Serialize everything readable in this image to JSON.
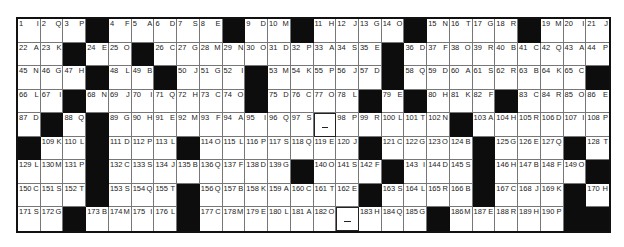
{
  "puzzle": {
    "type": "acrostic",
    "columns": 26,
    "rows": 9,
    "grid": [
      [
        {
          "n": "1",
          "c": "I"
        },
        {
          "n": "2",
          "c": "Q"
        },
        {
          "n": "3",
          "c": "P"
        },
        {
          "b": 1
        },
        {
          "n": "4",
          "c": "F"
        },
        {
          "n": "5",
          "c": "A"
        },
        {
          "n": "6",
          "c": "D"
        },
        {
          "n": "7",
          "c": "S"
        },
        {
          "n": "8",
          "c": "E"
        },
        {
          "b": 1
        },
        {
          "n": "9",
          "c": "D"
        },
        {
          "n": "10",
          "c": "M"
        },
        {
          "b": 1
        },
        {
          "n": "11",
          "c": "H"
        },
        {
          "n": "12",
          "c": "J"
        },
        {
          "n": "13",
          "c": "G"
        },
        {
          "n": "14",
          "c": "O"
        },
        {
          "b": 1
        },
        {
          "n": "15",
          "c": "N"
        },
        {
          "n": "16",
          "c": "T"
        },
        {
          "n": "17",
          "c": "G"
        },
        {
          "n": "18",
          "c": "R"
        },
        {
          "b": 1
        },
        {
          "n": "19",
          "c": "M"
        },
        {
          "n": "20",
          "c": "I"
        },
        {
          "n": "21",
          "c": "J"
        }
      ],
      [
        {
          "n": "22",
          "c": "A"
        },
        {
          "n": "23",
          "c": "K"
        },
        {
          "b": 1
        },
        {
          "n": "24",
          "c": "E"
        },
        {
          "n": "25",
          "c": "O"
        },
        {
          "b": 1
        },
        {
          "n": "26",
          "c": "C"
        },
        {
          "n": "27",
          "c": "G"
        },
        {
          "n": "28",
          "c": "M"
        },
        {
          "n": "29",
          "c": "N"
        },
        {
          "n": "30",
          "c": "O"
        },
        {
          "n": "31",
          "c": "D"
        },
        {
          "n": "32",
          "c": "P"
        },
        {
          "n": "33",
          "c": "A"
        },
        {
          "n": "34",
          "c": "S"
        },
        {
          "n": "35",
          "c": "E"
        },
        {
          "b": 1
        },
        {
          "n": "36",
          "c": "D"
        },
        {
          "n": "37",
          "c": "F"
        },
        {
          "n": "38",
          "c": "O"
        },
        {
          "n": "39",
          "c": "R"
        },
        {
          "n": "40",
          "c": "B"
        },
        {
          "n": "41",
          "c": "C"
        },
        {
          "n": "42",
          "c": "Q"
        },
        {
          "n": "43",
          "c": "A"
        },
        {
          "n": "44",
          "c": "P"
        }
      ],
      [
        {
          "n": "45",
          "c": "N"
        },
        {
          "n": "46",
          "c": "G"
        },
        {
          "n": "47",
          "c": "H"
        },
        {
          "b": 1
        },
        {
          "n": "48",
          "c": "L"
        },
        {
          "n": "49",
          "c": "B"
        },
        {
          "b": 1
        },
        {
          "n": "50",
          "c": "J"
        },
        {
          "n": "51",
          "c": "G"
        },
        {
          "n": "52",
          "c": "I"
        },
        {
          "b": 1
        },
        {
          "n": "53",
          "c": "M"
        },
        {
          "n": "54",
          "c": "K"
        },
        {
          "n": "55",
          "c": "P"
        },
        {
          "n": "56",
          "c": "J"
        },
        {
          "n": "57",
          "c": "D"
        },
        {
          "b": 1
        },
        {
          "n": "58",
          "c": "Q"
        },
        {
          "n": "59",
          "c": "D"
        },
        {
          "n": "60",
          "c": "A"
        },
        {
          "n": "61",
          "c": "S"
        },
        {
          "n": "62",
          "c": "R"
        },
        {
          "n": "63",
          "c": "B"
        },
        {
          "n": "64",
          "c": "K"
        },
        {
          "n": "65",
          "c": "C"
        },
        {
          "b": 1
        }
      ],
      [
        {
          "n": "66",
          "c": "L"
        },
        {
          "n": "67",
          "c": "I"
        },
        {
          "b": 1
        },
        {
          "n": "68",
          "c": "N"
        },
        {
          "n": "69",
          "c": "J"
        },
        {
          "n": "70",
          "c": "I"
        },
        {
          "n": "71",
          "c": "Q"
        },
        {
          "n": "72",
          "c": "H"
        },
        {
          "n": "73",
          "c": "C"
        },
        {
          "n": "74",
          "c": "O"
        },
        {
          "b": 1
        },
        {
          "n": "75",
          "c": "D"
        },
        {
          "n": "76",
          "c": "C"
        },
        {
          "n": "77",
          "c": "O"
        },
        {
          "n": "78",
          "c": "L"
        },
        {
          "b": 1
        },
        {
          "n": "79",
          "c": "E"
        },
        {
          "b": 1
        },
        {
          "n": "80",
          "c": "H"
        },
        {
          "n": "81",
          "c": "K"
        },
        {
          "n": "82",
          "c": "F"
        },
        {
          "b": 1
        },
        {
          "n": "83",
          "c": "C"
        },
        {
          "n": "84",
          "c": "R"
        },
        {
          "n": "85",
          "c": "O"
        },
        {
          "n": "86",
          "c": "E"
        }
      ],
      [
        {
          "n": "87",
          "c": "D"
        },
        {
          "b": 1
        },
        {
          "n": "88",
          "c": "Q"
        },
        {
          "b": 1
        },
        {
          "n": "89",
          "c": "G"
        },
        {
          "n": "90",
          "c": "H"
        },
        {
          "n": "91",
          "c": "E"
        },
        {
          "n": "92",
          "c": "M"
        },
        {
          "n": "93",
          "c": "F"
        },
        {
          "n": "94",
          "c": "A"
        },
        {
          "n": "95",
          "c": "I"
        },
        {
          "n": "96",
          "c": "Q"
        },
        {
          "n": "97",
          "c": "S"
        },
        {
          "d": 1
        },
        {
          "n": "98",
          "c": "P"
        },
        {
          "n": "99",
          "c": "R"
        },
        {
          "n": "100",
          "c": "L"
        },
        {
          "n": "101",
          "c": "T"
        },
        {
          "n": "102",
          "c": "N"
        },
        {
          "b": 1
        },
        {
          "n": "103",
          "c": "A"
        },
        {
          "n": "104",
          "c": "H"
        },
        {
          "n": "105",
          "c": "R"
        },
        {
          "n": "106",
          "c": "D"
        },
        {
          "n": "107",
          "c": "I"
        },
        {
          "n": "108",
          "c": "P"
        }
      ],
      [
        {
          "b": 1
        },
        {
          "n": "109",
          "c": "K"
        },
        {
          "n": "110",
          "c": "L"
        },
        {
          "b": 1
        },
        {
          "n": "111",
          "c": "D"
        },
        {
          "n": "112",
          "c": "P"
        },
        {
          "n": "113",
          "c": "L"
        },
        {
          "b": 1
        },
        {
          "n": "114",
          "c": "O"
        },
        {
          "n": "115",
          "c": "L"
        },
        {
          "n": "116",
          "c": "P"
        },
        {
          "n": "117",
          "c": "S"
        },
        {
          "n": "118",
          "c": "Q"
        },
        {
          "n": "119",
          "c": "E"
        },
        {
          "n": "120",
          "c": "J"
        },
        {
          "b": 1
        },
        {
          "n": "121",
          "c": "C"
        },
        {
          "n": "122",
          "c": "G"
        },
        {
          "n": "123",
          "c": "O"
        },
        {
          "n": "124",
          "c": "B"
        },
        {
          "b": 1
        },
        {
          "n": "125",
          "c": "G"
        },
        {
          "n": "126",
          "c": "E"
        },
        {
          "n": "127",
          "c": "Q"
        },
        {
          "b": 1
        },
        {
          "n": "128",
          "c": "T"
        }
      ],
      [
        {
          "n": "129",
          "c": "L"
        },
        {
          "n": "130",
          "c": "M"
        },
        {
          "n": "131",
          "c": "P"
        },
        {
          "b": 1
        },
        {
          "n": "132",
          "c": "C"
        },
        {
          "n": "133",
          "c": "S"
        },
        {
          "n": "134",
          "c": "J"
        },
        {
          "n": "135",
          "c": "B"
        },
        {
          "n": "136",
          "c": "Q"
        },
        {
          "n": "137",
          "c": "F"
        },
        {
          "n": "138",
          "c": "D"
        },
        {
          "n": "139",
          "c": "G"
        },
        {
          "b": 1
        },
        {
          "n": "140",
          "c": "O"
        },
        {
          "n": "141",
          "c": "S"
        },
        {
          "n": "142",
          "c": "F"
        },
        {
          "b": 1
        },
        {
          "n": "143",
          "c": "I"
        },
        {
          "n": "144",
          "c": "D"
        },
        {
          "n": "145",
          "c": "S"
        },
        {
          "b": 1
        },
        {
          "n": "146",
          "c": "H"
        },
        {
          "n": "147",
          "c": "B"
        },
        {
          "n": "148",
          "c": "F"
        },
        {
          "n": "149",
          "c": "O"
        },
        {
          "b": 1
        }
      ],
      [
        {
          "n": "150",
          "c": "C"
        },
        {
          "n": "151",
          "c": "S"
        },
        {
          "n": "152",
          "c": "T"
        },
        {
          "b": 1
        },
        {
          "n": "153",
          "c": "S"
        },
        {
          "n": "154",
          "c": "Q"
        },
        {
          "n": "155",
          "c": "T"
        },
        {
          "b": 1
        },
        {
          "n": "156",
          "c": "Q"
        },
        {
          "n": "157",
          "c": "B"
        },
        {
          "n": "158",
          "c": "K"
        },
        {
          "n": "159",
          "c": "A"
        },
        {
          "n": "160",
          "c": "C"
        },
        {
          "n": "161",
          "c": "T"
        },
        {
          "n": "162",
          "c": "E"
        },
        {
          "b": 1
        },
        {
          "n": "163",
          "c": "S"
        },
        {
          "n": "164",
          "c": "L"
        },
        {
          "n": "165",
          "c": "R"
        },
        {
          "n": "166",
          "c": "B"
        },
        {
          "b": 1
        },
        {
          "n": "167",
          "c": "C"
        },
        {
          "n": "168",
          "c": "J"
        },
        {
          "n": "169",
          "c": "K"
        },
        {
          "b": 1
        },
        {
          "n": "170",
          "c": "H"
        }
      ],
      [
        {
          "n": "171",
          "c": "S"
        },
        {
          "n": "172",
          "c": "G"
        },
        {
          "b": 1
        },
        {
          "n": "173",
          "c": "B"
        },
        {
          "n": "174",
          "c": "M"
        },
        {
          "n": "175",
          "c": "I"
        },
        {
          "n": "176",
          "c": "L"
        },
        {
          "b": 1
        },
        {
          "n": "177",
          "c": "C"
        },
        {
          "n": "178",
          "c": "M"
        },
        {
          "n": "179",
          "c": "E"
        },
        {
          "n": "180",
          "c": "L"
        },
        {
          "n": "181",
          "c": "A"
        },
        {
          "n": "182",
          "c": "O"
        },
        {
          "d": 1
        },
        {
          "n": "183",
          "c": "H"
        },
        {
          "n": "184",
          "c": "Q"
        },
        {
          "n": "185",
          "c": "G"
        },
        {
          "b": 1
        },
        {
          "n": "186",
          "c": "M"
        },
        {
          "n": "187",
          "c": "E"
        },
        {
          "n": "188",
          "c": "R"
        },
        {
          "n": "189",
          "c": "H"
        },
        {
          "n": "190",
          "c": "P"
        },
        {
          "b": 1
        },
        {
          "b": 1
        }
      ]
    ],
    "colors": {
      "black_cell": "#0d0d0d",
      "grid_line": "#777777",
      "border": "#111111"
    }
  }
}
